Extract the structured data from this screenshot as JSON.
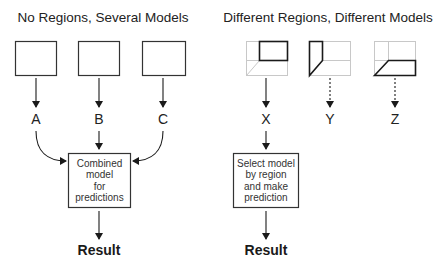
{
  "left_panel": {
    "title": "No Regions, Several Models",
    "models": [
      {
        "label": "A",
        "arrow": "solid"
      },
      {
        "label": "B",
        "arrow": "solid"
      },
      {
        "label": "C",
        "arrow": "solid"
      }
    ],
    "combiner_box": {
      "lines": [
        "Combined",
        "model",
        "for",
        "predictions"
      ]
    },
    "result": "Result"
  },
  "right_panel": {
    "title": "Different Regions, Different Models",
    "models": [
      {
        "label": "X",
        "arrow": "solid",
        "region": "top-right"
      },
      {
        "label": "Y",
        "arrow": "dotted",
        "region": "left"
      },
      {
        "label": "Z",
        "arrow": "dotted",
        "region": "bottom"
      }
    ],
    "selector_box": {
      "lines": [
        "Select model",
        "by region",
        "and make",
        "prediction"
      ]
    },
    "result": "Result"
  },
  "colors": {
    "stroke": "#1a1a1a",
    "grid": "#c8c8c8",
    "text": "#222222"
  }
}
